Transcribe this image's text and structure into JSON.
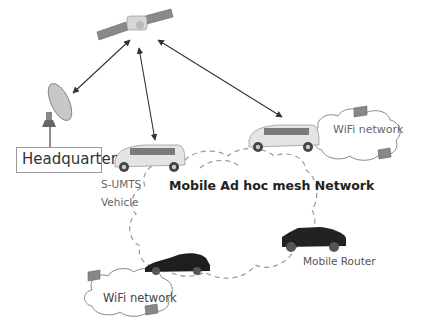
{
  "diagram": {
    "nodes": [
      {
        "id": "satellite",
        "label": "",
        "type": "satellite"
      },
      {
        "id": "dish",
        "label": "",
        "type": "satellite-dish"
      },
      {
        "id": "headquarter",
        "label": "Headquarter",
        "type": "box"
      },
      {
        "id": "sumts-vehicle",
        "label": "S-UMTS\nVehicle",
        "type": "van"
      },
      {
        "id": "van-2",
        "label": "",
        "type": "van"
      },
      {
        "id": "sports-car",
        "label": "",
        "type": "car"
      },
      {
        "id": "mobile-router",
        "label": "Mobile Router",
        "type": "suv"
      },
      {
        "id": "wifi-1",
        "label": "WiFi network",
        "type": "cloud"
      },
      {
        "id": "wifi-2",
        "label": "WiFi network",
        "type": "cloud"
      },
      {
        "id": "mesh",
        "label": "Mobile Ad hoc mesh Network",
        "type": "dashed-cloud"
      }
    ],
    "edges": [
      {
        "from": "satellite",
        "to": "dish",
        "style": "double-arrow"
      },
      {
        "from": "satellite",
        "to": "sumts-vehicle",
        "style": "double-arrow"
      },
      {
        "from": "satellite",
        "to": "van-2",
        "style": "double-arrow"
      },
      {
        "from": "dish",
        "to": "headquarter",
        "style": "line"
      }
    ]
  },
  "labels": {
    "headquarter": "Headquarter",
    "sumts_line1": "S-UMTS",
    "sumts_line2": "Vehicle",
    "mesh_network": "Mobile Ad hoc mesh Network",
    "wifi_top": "WiFi network",
    "wifi_bottom": "WiFi network",
    "mobile_router": "Mobile Router"
  }
}
